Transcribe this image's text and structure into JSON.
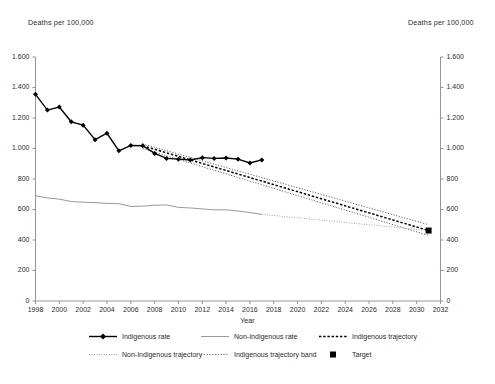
{
  "chart_data": {
    "type": "line",
    "title": "",
    "xlabel": "Year",
    "ylabel": "Deaths per 100,000",
    "ylabel_right": "Deaths per 100,000",
    "xlim": [
      1998,
      2032
    ],
    "ylim": [
      0,
      1600
    ],
    "ytick_step": 200,
    "xtick_step": 2,
    "grid": false,
    "legend_position": "bottom",
    "ytick_labels": [
      "0",
      "200",
      "400",
      "600",
      "800",
      "1.000",
      "1.200",
      "1.400",
      "1.600"
    ],
    "ytick_values": [
      0,
      200,
      400,
      600,
      800,
      1000,
      1200,
      1400,
      1600
    ],
    "xtick_labels": [
      "1998",
      "2000",
      "2002",
      "2004",
      "2006",
      "2008",
      "2010",
      "2012",
      "2014",
      "2016",
      "2018",
      "2020",
      "2022",
      "2024",
      "2026",
      "2028",
      "2030",
      "2032"
    ],
    "xtick_values": [
      1998,
      2000,
      2002,
      2004,
      2006,
      2008,
      2010,
      2012,
      2014,
      2016,
      2018,
      2020,
      2022,
      2024,
      2026,
      2028,
      2030,
      2032
    ],
    "series": [
      {
        "name": "Indigenous rate",
        "style": "solid-marker",
        "color": "#000000",
        "x": [
          1998,
          1999,
          2000,
          2001,
          2002,
          2003,
          2004,
          2005,
          2006,
          2007,
          2008,
          2009,
          2010,
          2011,
          2012,
          2013,
          2014,
          2015,
          2016,
          2017
        ],
        "values": [
          1355,
          1252,
          1272,
          1175,
          1153,
          1058,
          1100,
          985,
          1020,
          1018,
          968,
          935,
          930,
          925,
          940,
          935,
          938,
          930,
          905,
          925
        ]
      },
      {
        "name": "Non-Indigenous rate",
        "style": "solid-thin",
        "color": "#8c8c8c",
        "x": [
          1998,
          1999,
          2000,
          2001,
          2002,
          2003,
          2004,
          2005,
          2006,
          2007,
          2008,
          2009,
          2010,
          2011,
          2012,
          2013,
          2014,
          2015,
          2016,
          2017
        ],
        "values": [
          690,
          676,
          668,
          652,
          648,
          645,
          640,
          638,
          620,
          622,
          628,
          630,
          614,
          610,
          604,
          598,
          598,
          590,
          580,
          568
        ]
      },
      {
        "name": "Indigenous trajectory",
        "style": "dashed-heavy",
        "color": "#000000",
        "x": [
          2007,
          2031
        ],
        "values": [
          1018,
          462
        ]
      },
      {
        "name": "Non-Indigenous trajectory",
        "style": "dotted-light",
        "color": "#9a9a9a",
        "x": [
          2017,
          2031
        ],
        "values": [
          568,
          462
        ]
      },
      {
        "name": "Indigenous trajectory band",
        "style": "dotted-band",
        "color": "#555555",
        "x": [
          2007,
          2031
        ],
        "upper": [
          1030,
          500
        ],
        "lower": [
          1000,
          430
        ]
      },
      {
        "name": "Target",
        "style": "square-marker",
        "color": "#000000",
        "x": [
          2031
        ],
        "values": [
          462
        ]
      }
    ],
    "legend_entries": [
      {
        "label": "Indigenous rate",
        "key": "line-diamond",
        "color": "#000000"
      },
      {
        "label": "Non-Indigenous rate",
        "key": "line-thin",
        "color": "#8c8c8c"
      },
      {
        "label": "Indigenous trajectory",
        "key": "line-dashed-heavy",
        "color": "#000000"
      },
      {
        "label": "Non-Indigenous trajectory",
        "key": "line-dotted-light",
        "color": "#9a9a9a"
      },
      {
        "label": "Indigenous trajectory band",
        "key": "line-dotted-band",
        "color": "#555555"
      },
      {
        "label": "Target",
        "key": "square",
        "color": "#000000"
      }
    ]
  }
}
